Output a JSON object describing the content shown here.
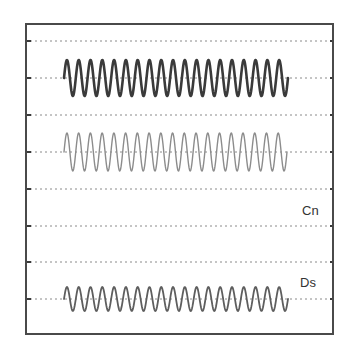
{
  "chart_data": {
    "type": "line",
    "title": "",
    "xlabel": "",
    "ylabel": "",
    "grid": true,
    "grid_style": "dotted horizontal",
    "frame": {
      "x": 26,
      "y": 24,
      "width": 307,
      "height": 310
    },
    "gridlines_y": [
      41,
      78,
      115,
      152,
      189,
      226,
      262,
      299
    ],
    "labels": [
      {
        "text": "Cn",
        "x": 302,
        "y": 215
      },
      {
        "text": "Ds",
        "x": 300,
        "y": 287
      }
    ],
    "series": [
      {
        "name": "trace-1",
        "description": "dark thick sinusoid",
        "center_y": 78,
        "amplitude": 18,
        "x_start": 64,
        "x_end": 288,
        "cycles": 19,
        "color": "#3a3a3a",
        "stroke_width": 2.6
      },
      {
        "name": "trace-2",
        "description": "light thin sinusoid",
        "center_y": 152,
        "amplitude": 19,
        "x_start": 64,
        "x_end": 287,
        "cycles": 19,
        "color": "#8c8c8c",
        "stroke_width": 1.4
      },
      {
        "name": "Ds",
        "description": "medium sinusoid",
        "center_y": 299,
        "amplitude": 12,
        "x_start": 64,
        "x_end": 288,
        "cycles": 19,
        "color": "#5e5e5e",
        "stroke_width": 1.8
      }
    ]
  }
}
